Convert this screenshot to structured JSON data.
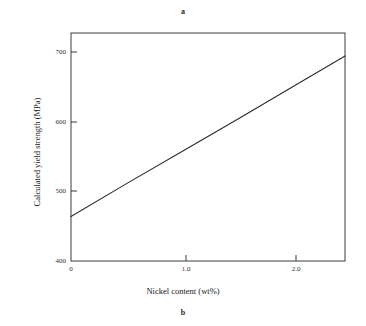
{
  "figure": {
    "caption_top": "a",
    "caption_bottom": "b",
    "background_color": "#ffffff",
    "line_color": "#2b2b2b",
    "axis_color": "#3a3a3a"
  },
  "chart_data": {
    "type": "line",
    "title": "",
    "xlabel": "Nickel content (wt%)",
    "ylabel": "Calculated yield strength (MPa)",
    "xlim": [
      0,
      2.43
    ],
    "ylim": [
      400,
      728
    ],
    "xticks": [
      0,
      1.0,
      2.0
    ],
    "xtick_labels": [
      "0",
      "1.0",
      "2.0"
    ],
    "yticks": [
      400,
      500,
      600,
      700
    ],
    "ytick_labels": [
      "400",
      "500",
      "600",
      "700"
    ],
    "grid": false,
    "legend": null,
    "tick_direction": "in",
    "series": [
      {
        "name": "Calculated yield strength",
        "x": [
          0,
          0.5,
          1.0,
          1.5,
          2.0,
          2.43
        ],
        "values": [
          464,
          512,
          559,
          606,
          654,
          695
        ]
      }
    ],
    "annotations": []
  }
}
